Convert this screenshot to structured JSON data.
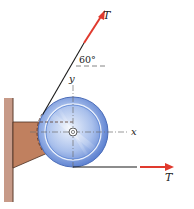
{
  "diagram": {
    "labels": {
      "tension_top": "T",
      "tension_bottom": "T",
      "angle": "60°",
      "x_axis": "x",
      "y_axis": "y"
    },
    "colors": {
      "arrow": "#e03a2e",
      "rope": "#1a1a1a",
      "bracket": "#c0805f",
      "bracket_edge": "#5a3a2a",
      "wall": "#b98a78",
      "wheel_outer": "#5b82d6",
      "wheel_inner": "#c9d8f3",
      "axis_line": "#7a7a7a"
    },
    "geometry": {
      "wheel_center": [
        73,
        132
      ],
      "wheel_radius": 35,
      "rope_angle_deg": 60
    }
  }
}
